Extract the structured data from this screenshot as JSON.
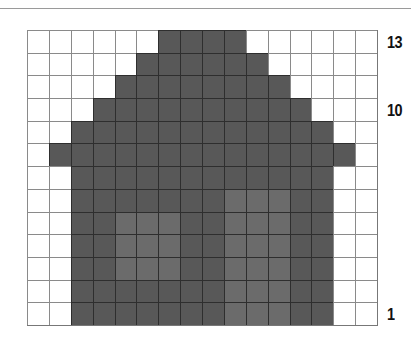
{
  "pattern": {
    "columns": 16,
    "rows": 13,
    "colors": {
      "background": "#ffffff",
      "fill": "#585858",
      "fill_light": "#6b6b6b",
      "grid_line": "#8a8a8a"
    },
    "row_labels": [
      {
        "row": 13,
        "text": "13"
      },
      {
        "row": 10,
        "text": "10"
      },
      {
        "row": 1,
        "text": "1"
      }
    ],
    "rows_from_top": [
      {
        "row": 13,
        "fill": [
          6,
          9
        ]
      },
      {
        "row": 12,
        "fill": [
          5,
          10
        ]
      },
      {
        "row": 11,
        "fill": [
          4,
          11
        ]
      },
      {
        "row": 10,
        "fill": [
          3,
          12
        ]
      },
      {
        "row": 9,
        "fill": [
          2,
          13
        ]
      },
      {
        "row": 8,
        "fill": [
          1,
          14
        ]
      },
      {
        "row": 7,
        "fill": [
          2,
          13
        ]
      },
      {
        "row": 6,
        "fill": [
          2,
          13
        ],
        "light": [
          [
            9,
            11
          ]
        ]
      },
      {
        "row": 5,
        "fill": [
          2,
          13
        ],
        "light": [
          [
            4,
            6
          ],
          [
            9,
            11
          ]
        ]
      },
      {
        "row": 4,
        "fill": [
          2,
          13
        ],
        "light": [
          [
            4,
            6
          ],
          [
            9,
            11
          ]
        ]
      },
      {
        "row": 3,
        "fill": [
          2,
          13
        ],
        "light": [
          [
            4,
            6
          ],
          [
            9,
            11
          ]
        ]
      },
      {
        "row": 2,
        "fill": [
          2,
          13
        ],
        "light": [
          [
            9,
            11
          ]
        ]
      },
      {
        "row": 1,
        "fill": [
          2,
          13
        ],
        "light": [
          [
            9,
            11
          ]
        ]
      }
    ]
  }
}
